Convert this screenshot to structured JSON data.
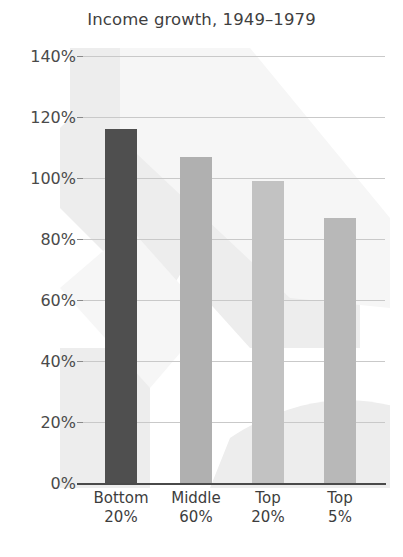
{
  "chart_data": {
    "type": "bar",
    "title": "Income growth, 1949–1979",
    "xlabel": "",
    "ylabel": "",
    "categories": [
      "Bottom 20%",
      "Middle 60%",
      "Top 20%",
      "Top 5%"
    ],
    "category_lines": [
      {
        "line1": "Bottom",
        "line2": "20%"
      },
      {
        "line1": "Middle",
        "line2": "60%"
      },
      {
        "line1": "Top",
        "line2": "20%"
      },
      {
        "line1": "Top",
        "line2": "5%"
      }
    ],
    "values": [
      116,
      107,
      99,
      87
    ],
    "value_labels": [
      "116%",
      "107%",
      "99%",
      "87%"
    ],
    "bar_colors": [
      "#4f4f4f",
      "#b0b0b0",
      "#c2c2c2",
      "#b8b8b8"
    ],
    "ylim": [
      0,
      140
    ],
    "ytick_values": [
      0,
      20,
      40,
      60,
      80,
      100,
      120,
      140
    ],
    "ytick_labels": [
      "0%",
      "20%",
      "40%",
      "60%",
      "80%",
      "100%",
      "120%",
      "140%"
    ],
    "grid": true,
    "legend": "none",
    "colors": {
      "gridline": "#c9c9c9",
      "axis": "#4a4a4a",
      "text": "#3d3d3d",
      "background": "#ffffff"
    }
  }
}
